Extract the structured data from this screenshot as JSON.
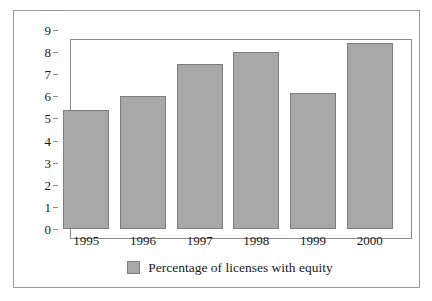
{
  "chart_data": {
    "type": "bar",
    "title": "",
    "xlabel": "",
    "ylabel": "",
    "categories": [
      "1995",
      "1996",
      "1997",
      "1998",
      "1999",
      "2000"
    ],
    "values": [
      5.4,
      6.0,
      7.45,
      8.0,
      6.17,
      8.4
    ],
    "series": [
      {
        "name": "Percentage of licenses with equity",
        "values": [
          5.4,
          6.0,
          7.45,
          8.0,
          6.17,
          8.4
        ]
      }
    ],
    "ylim": [
      0,
      9
    ],
    "ytick_labels": [
      "9",
      "8",
      "7",
      "6",
      "5",
      "4",
      "3",
      "2",
      "1",
      "0"
    ],
    "ytick_values": [
      9,
      8,
      7,
      6,
      5,
      4,
      3,
      2,
      1,
      0
    ],
    "grid": false,
    "legend_position": "bottom",
    "legend": [
      {
        "label": "Percentage of licenses with equity",
        "swatch_name": "legend-swatch-percentage-of-licenses-with-equity"
      }
    ],
    "colors": {
      "bar_fill": "#a8a8a8",
      "bar_edge": "#7d7d7d",
      "axis": "#8c8c8c",
      "outer_border": "#9a9a9a",
      "text": "#1a1a1a",
      "background": "#ffffff"
    }
  }
}
